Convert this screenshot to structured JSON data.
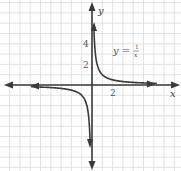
{
  "chart_data": {
    "type": "line",
    "title": "",
    "equation": "y = 1/x",
    "equation_label": {
      "lhs": "y",
      "equals": "=",
      "numerator": "1",
      "denominator": "x"
    },
    "xlabel": "x",
    "ylabel": "y",
    "x_tick_labels": [
      "2"
    ],
    "y_tick_labels": [
      "4",
      "2"
    ],
    "xlim": [
      -8.5,
      8.5
    ],
    "ylim": [
      -8,
      8
    ],
    "grid": true,
    "legend": null,
    "series": [
      {
        "name": "y = 1/x (x > 0)",
        "x": [
          0.2,
          0.25,
          0.33,
          0.5,
          1,
          2,
          3,
          4,
          5,
          6,
          7.5
        ],
        "y": [
          5,
          4,
          3,
          2,
          1,
          0.5,
          0.333,
          0.25,
          0.2,
          0.167,
          0.133
        ]
      },
      {
        "name": "y = 1/x (x < 0)",
        "x": [
          -7.5,
          -6,
          -5,
          -4,
          -3,
          -2,
          -1,
          -0.5,
          -0.33,
          -0.25,
          -0.2
        ],
        "y": [
          -0.133,
          -0.167,
          -0.2,
          -0.25,
          -0.333,
          -0.5,
          -1,
          -2,
          -3,
          -4,
          -5
        ]
      }
    ],
    "asymptotes": [
      "x = 0",
      "y = 0"
    ]
  },
  "colors": {
    "axis": "#3a3a3a",
    "curve": "#3a3a3a",
    "grid": "#dcdcdc",
    "background": "#ffffff"
  },
  "labels": {
    "x_axis": "x",
    "y_axis": "y",
    "x_tick_2": "2",
    "y_tick_4": "4",
    "y_tick_2": "2",
    "eq_lhs": "y =",
    "eq_num": "1",
    "eq_den": "x"
  }
}
